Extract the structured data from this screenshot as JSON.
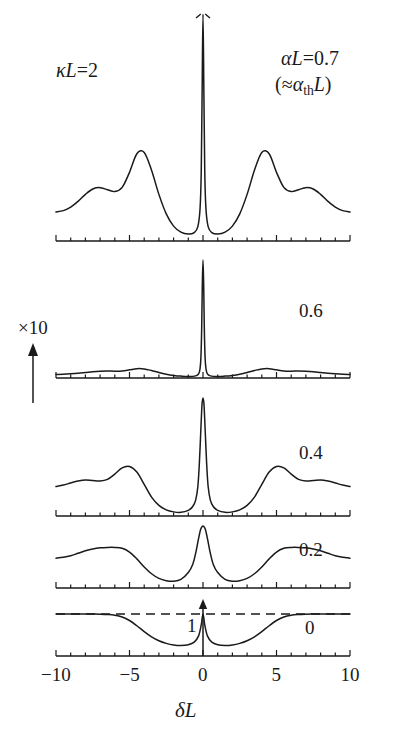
{
  "figure": {
    "annotations": {
      "kappa_label": "κL=2",
      "alpha_label": "αL=0.7",
      "alpha_th_label": "(≈αthL)",
      "scale_label": "×10",
      "unity_label": "1",
      "xaxis_title": "δL"
    },
    "axis": {
      "tick_labels": [
        "−10",
        "−5",
        "0",
        "5",
        "10"
      ],
      "tick_values": [
        -10,
        -5,
        0,
        5,
        10
      ],
      "xmin": -10,
      "xmax": 10,
      "minor_tick_step": 1,
      "major_tick_step": 5
    },
    "panel_labels": [
      "0.7",
      "0.6",
      "0.4",
      "0.2",
      "0"
    ]
  },
  "chart_data": {
    "type": "line",
    "title": "",
    "subtitle": "",
    "xlabel": "δL",
    "ylabel": "",
    "xlim": [
      -10,
      10
    ],
    "grid": false,
    "legend_position": "none",
    "stacked_panels": true,
    "annotations": [
      {
        "text": "κL=2",
        "x": -7.5,
        "panel": 0
      },
      {
        "text": "αL=0.7",
        "x": 7.5,
        "panel": 0
      },
      {
        "text": "(≈αthL)",
        "x": 7.5,
        "panel": 0
      },
      {
        "text": "×10",
        "x": -11.5,
        "panel": 1,
        "note": "vertical scale multiplier with up arrow"
      },
      {
        "text": "1",
        "x": -0.8,
        "panel": 4,
        "note": "unity reference level, dashed line"
      }
    ],
    "panels": [
      {
        "name": "alphaL-0.7",
        "label": "0.7",
        "label_note": "≈ αth L, near threshold",
        "ymax": 1.0,
        "clipped_peak": true,
        "series": [
          {
            "name": "spectrum",
            "style": "solid",
            "x": [
              -10.0,
              -9.5,
              -9.0,
              -8.5,
              -8.0,
              -7.5,
              -7.0,
              -6.5,
              -6.0,
              -5.5,
              -5.0,
              -4.5,
              -4.0,
              -3.5,
              -3.0,
              -2.5,
              -2.0,
              -1.5,
              -1.0,
              -0.6,
              -0.35,
              -0.2,
              -0.12,
              -0.06,
              0.0,
              0.06,
              0.12,
              0.2,
              0.35,
              0.6,
              1.0,
              1.5,
              2.0,
              2.5,
              3.0,
              3.5,
              4.0,
              4.5,
              5.0,
              5.5,
              6.0,
              6.5,
              7.0,
              7.5,
              8.0,
              8.5,
              9.0,
              9.5,
              10.0
            ],
            "y": [
              0.125,
              0.131,
              0.146,
              0.171,
              0.201,
              0.224,
              0.23,
              0.221,
              0.213,
              0.231,
              0.296,
              0.376,
              0.382,
              0.305,
              0.201,
              0.117,
              0.064,
              0.038,
              0.03,
              0.036,
              0.062,
              0.14,
              0.3,
              0.64,
              1.0,
              0.64,
              0.3,
              0.14,
              0.062,
              0.036,
              0.03,
              0.038,
              0.064,
              0.117,
              0.201,
              0.305,
              0.382,
              0.376,
              0.296,
              0.231,
              0.213,
              0.221,
              0.23,
              0.224,
              0.201,
              0.171,
              0.146,
              0.131,
              0.125
            ]
          }
        ]
      },
      {
        "name": "alphaL-0.6",
        "label": "0.6",
        "ymax": 1.0,
        "clipped_peak": false,
        "series": [
          {
            "name": "spectrum",
            "style": "solid",
            "x": [
              -10.0,
              -9.5,
              -9.0,
              -8.5,
              -8.0,
              -7.5,
              -7.0,
              -6.5,
              -6.0,
              -5.5,
              -5.0,
              -4.5,
              -4.0,
              -3.5,
              -3.0,
              -2.5,
              -2.0,
              -1.5,
              -1.0,
              -0.5,
              -0.3,
              -0.2,
              -0.14,
              -0.09,
              -0.05,
              0.0,
              0.05,
              0.09,
              0.14,
              0.2,
              0.3,
              0.5,
              1.0,
              1.5,
              2.0,
              2.5,
              3.0,
              3.5,
              4.0,
              4.5,
              5.0,
              5.5,
              6.0,
              6.5,
              7.0,
              7.5,
              8.0,
              8.5,
              9.0,
              9.5,
              10.0
            ],
            "y": [
              0.03,
              0.032,
              0.036,
              0.041,
              0.047,
              0.053,
              0.057,
              0.059,
              0.058,
              0.06,
              0.069,
              0.079,
              0.077,
              0.063,
              0.046,
              0.032,
              0.022,
              0.016,
              0.013,
              0.018,
              0.035,
              0.08,
              0.18,
              0.42,
              0.76,
              1.0,
              0.76,
              0.42,
              0.18,
              0.08,
              0.035,
              0.018,
              0.013,
              0.016,
              0.022,
              0.032,
              0.046,
              0.063,
              0.077,
              0.079,
              0.069,
              0.06,
              0.058,
              0.059,
              0.057,
              0.053,
              0.047,
              0.041,
              0.036,
              0.032,
              0.03
            ]
          }
        ]
      },
      {
        "name": "alphaL-0.4",
        "label": "0.4",
        "ymax": 1.0,
        "clipped_peak": false,
        "series": [
          {
            "name": "spectrum",
            "style": "solid",
            "x": [
              -10.0,
              -9.5,
              -9.0,
              -8.5,
              -8.0,
              -7.5,
              -7.0,
              -6.5,
              -6.0,
              -5.5,
              -5.0,
              -4.5,
              -4.0,
              -3.5,
              -3.0,
              -2.5,
              -2.0,
              -1.5,
              -1.0,
              -0.7,
              -0.5,
              -0.35,
              -0.25,
              -0.15,
              -0.07,
              0.0,
              0.07,
              0.15,
              0.25,
              0.35,
              0.5,
              0.7,
              1.0,
              1.5,
              2.0,
              2.5,
              3.0,
              3.5,
              4.0,
              4.5,
              5.0,
              5.5,
              6.0,
              6.5,
              7.0,
              7.5,
              8.0,
              8.5,
              9.0,
              9.5,
              10.0
            ],
            "y": [
              0.25,
              0.262,
              0.28,
              0.296,
              0.305,
              0.3,
              0.296,
              0.31,
              0.355,
              0.408,
              0.42,
              0.372,
              0.268,
              0.16,
              0.09,
              0.052,
              0.035,
              0.031,
              0.048,
              0.08,
              0.135,
              0.25,
              0.44,
              0.72,
              0.94,
              1.0,
              0.94,
              0.72,
              0.44,
              0.25,
              0.135,
              0.08,
              0.048,
              0.031,
              0.035,
              0.052,
              0.09,
              0.16,
              0.268,
              0.372,
              0.42,
              0.408,
              0.355,
              0.31,
              0.296,
              0.3,
              0.305,
              0.296,
              0.28,
              0.262,
              0.25
            ]
          }
        ]
      },
      {
        "name": "alphaL-0.2",
        "label": "0.2",
        "ymax": 1.0,
        "clipped_peak": false,
        "series": [
          {
            "name": "spectrum",
            "style": "solid",
            "x": [
              -10.0,
              -9.5,
              -9.0,
              -8.5,
              -8.0,
              -7.5,
              -7.0,
              -6.5,
              -6.0,
              -5.5,
              -5.0,
              -4.5,
              -4.0,
              -3.5,
              -3.0,
              -2.5,
              -2.0,
              -1.5,
              -1.0,
              -0.7,
              -0.5,
              -0.3,
              -0.15,
              0.0,
              0.15,
              0.3,
              0.5,
              0.7,
              1.0,
              1.5,
              2.0,
              2.5,
              3.0,
              3.5,
              4.0,
              4.5,
              5.0,
              5.5,
              6.0,
              6.5,
              7.0,
              7.5,
              8.0,
              8.5,
              9.0,
              9.5,
              10.0
            ],
            "y": [
              0.48,
              0.495,
              0.52,
              0.56,
              0.6,
              0.63,
              0.648,
              0.655,
              0.655,
              0.64,
              0.58,
              0.47,
              0.34,
              0.23,
              0.155,
              0.118,
              0.11,
              0.14,
              0.25,
              0.38,
              0.56,
              0.8,
              0.95,
              1.0,
              0.95,
              0.8,
              0.56,
              0.38,
              0.25,
              0.14,
              0.11,
              0.118,
              0.155,
              0.23,
              0.34,
              0.47,
              0.58,
              0.64,
              0.655,
              0.655,
              0.648,
              0.63,
              0.6,
              0.56,
              0.52,
              0.495,
              0.48
            ]
          }
        ]
      },
      {
        "name": "alphaL-0",
        "label": "0",
        "ymax": 1.0,
        "clipped_peak": false,
        "has_delta_function": true,
        "delta_x": 0,
        "series": [
          {
            "name": "spectrum",
            "style": "solid",
            "x": [
              -10.0,
              -9.5,
              -9.0,
              -8.5,
              -8.0,
              -7.5,
              -7.0,
              -6.5,
              -6.0,
              -5.5,
              -5.0,
              -4.5,
              -4.0,
              -3.5,
              -3.0,
              -2.5,
              -2.0,
              -1.5,
              -1.0,
              -0.6,
              -0.3,
              -0.12,
              0.0,
              0.12,
              0.3,
              0.6,
              1.0,
              1.5,
              2.0,
              2.5,
              3.0,
              3.5,
              4.0,
              4.5,
              5.0,
              5.5,
              6.0,
              6.5,
              7.0,
              7.5,
              8.0,
              8.5,
              9.0,
              9.5,
              10.0
            ],
            "y": [
              1.0,
              1.0,
              1.0,
              1.0,
              1.0,
              0.998,
              0.995,
              0.988,
              0.972,
              0.93,
              0.845,
              0.72,
              0.58,
              0.455,
              0.362,
              0.3,
              0.262,
              0.25,
              0.268,
              0.33,
              0.48,
              0.74,
              1.0,
              0.74,
              0.48,
              0.33,
              0.268,
              0.25,
              0.262,
              0.3,
              0.362,
              0.455,
              0.58,
              0.72,
              0.845,
              0.93,
              0.972,
              0.988,
              0.995,
              0.998,
              1.0,
              1.0,
              1.0,
              1.0,
              1.0
            ]
          },
          {
            "name": "unity-reference",
            "style": "dashed",
            "x": [
              -10.0,
              10.0
            ],
            "y": [
              1.0,
              1.0
            ]
          }
        ]
      }
    ]
  }
}
